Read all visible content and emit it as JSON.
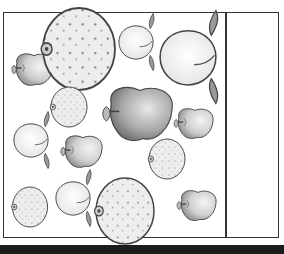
{
  "worksheet": {
    "description": "Fruit counting worksheet with apples, oranges and peaches",
    "answer_box": ""
  },
  "colors": {
    "outline": "#333333",
    "apple_fill": "#d9d9d9",
    "orange_fill": "#ececec",
    "peach_fill": "#f4f4f4",
    "leaf": "#8a8a8a",
    "bar": "#1c1c1c"
  },
  "fruits": [
    {
      "type": "apple",
      "x": 33,
      "y": 69,
      "size": "small"
    },
    {
      "type": "orange",
      "x": 79,
      "y": 49,
      "size": "large"
    },
    {
      "type": "peach",
      "x": 136,
      "y": 42,
      "size": "small"
    },
    {
      "type": "peach",
      "x": 188,
      "y": 55,
      "size": "large"
    },
    {
      "type": "orange",
      "x": 69,
      "y": 107,
      "size": "small"
    },
    {
      "type": "apple",
      "x": 138,
      "y": 113,
      "size": "large"
    },
    {
      "type": "apple",
      "x": 194,
      "y": 123,
      "size": "small"
    },
    {
      "type": "peach",
      "x": 31,
      "y": 141,
      "size": "small"
    },
    {
      "type": "apple",
      "x": 82,
      "y": 151,
      "size": "small"
    },
    {
      "type": "orange",
      "x": 167,
      "y": 159,
      "size": "small"
    },
    {
      "type": "orange",
      "x": 29,
      "y": 207,
      "size": "small"
    },
    {
      "type": "peach",
      "x": 73,
      "y": 199,
      "size": "small"
    },
    {
      "type": "orange",
      "x": 125,
      "y": 203,
      "size": "large"
    },
    {
      "type": "apple",
      "x": 196,
      "y": 205,
      "size": "small"
    }
  ]
}
